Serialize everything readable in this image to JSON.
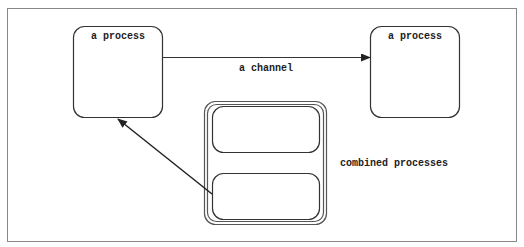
{
  "diagram": {
    "colors": {
      "stroke": "#333333",
      "frame": "#888888",
      "background": "#ffffff"
    },
    "nodes": [
      {
        "id": "process-left",
        "label": "a process"
      },
      {
        "id": "process-right",
        "label": "a process"
      },
      {
        "id": "combined",
        "label": "combined processes",
        "children": [
          "inner-top",
          "inner-bottom"
        ]
      }
    ],
    "edges": [
      {
        "from": "process-left",
        "to": "process-right",
        "label": "a channel"
      },
      {
        "from": "inner-bottom",
        "to": "process-left",
        "label": ""
      }
    ]
  }
}
